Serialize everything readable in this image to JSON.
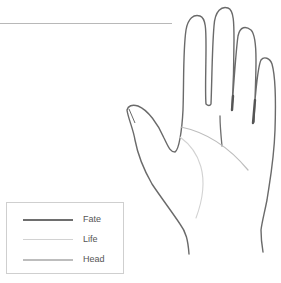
{
  "diagram": {
    "lines": [
      {
        "name": "Fate",
        "color": "#6e6e6e",
        "width": 1.6
      },
      {
        "name": "Life",
        "color": "#cfcfcf",
        "width": 1.0
      },
      {
        "name": "Head",
        "color": "#bdbdbd",
        "width": 1.2
      }
    ]
  },
  "legend": {
    "items": [
      {
        "label": "Fate",
        "color": "#6e6e6e",
        "thickness": "2px"
      },
      {
        "label": "Life",
        "color": "#d2d2d2",
        "thickness": "1px"
      },
      {
        "label": "Head",
        "color": "#bdbdbd",
        "thickness": "1.5px"
      }
    ]
  }
}
